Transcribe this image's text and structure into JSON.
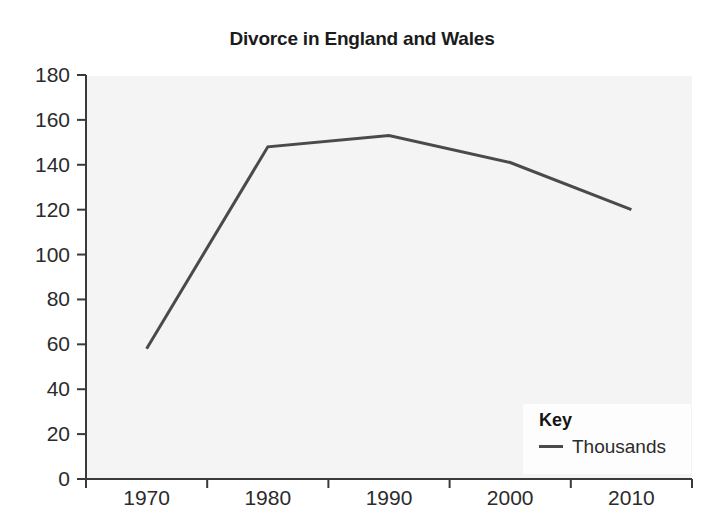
{
  "chart_data": {
    "type": "line",
    "title": "Divorce in England and Wales",
    "xlabel": "",
    "ylabel": "",
    "categories": [
      "1970",
      "1980",
      "1990",
      "2000",
      "2010"
    ],
    "x": [
      1970,
      1980,
      1990,
      2000,
      2010
    ],
    "series": [
      {
        "name": "Thousands",
        "values": [
          58,
          148,
          153,
          141,
          120
        ],
        "color": "#4a4a4a"
      }
    ],
    "ylim": [
      0,
      180
    ],
    "ytick_values": [
      180,
      160,
      140,
      120,
      100,
      80,
      60,
      40,
      20,
      0
    ],
    "ytick_labels": [
      "180",
      "160",
      "140",
      "120",
      "100",
      "80",
      "60",
      "40",
      "20",
      "0"
    ],
    "xtick_labels": [
      "1970",
      "1980",
      "1990",
      "2000",
      "2010"
    ],
    "grid": false,
    "legend_position": "inside-bottom-right"
  },
  "legend": {
    "title": "Key",
    "entries": [
      {
        "label": "Thousands",
        "color": "#4a4a4a",
        "marker": "line"
      }
    ]
  },
  "axes": {
    "axis_color": "#3a3a3a",
    "plot_background": "#f4f4f4"
  }
}
